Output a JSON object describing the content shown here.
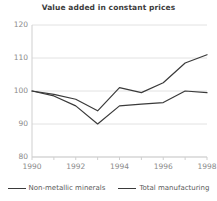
{
  "chart_data": {
    "type": "line",
    "title": "Value added in constant prices",
    "xlabel": "",
    "ylabel": "",
    "x": [
      1990,
      1991,
      1992,
      1993,
      1994,
      1995,
      1996,
      1997,
      1998
    ],
    "xlim": [
      1990,
      1998
    ],
    "ylim": [
      80,
      120
    ],
    "yticks": [
      80,
      90,
      100,
      110,
      120
    ],
    "xticks": [
      1990,
      1992,
      1994,
      1996,
      1998
    ],
    "xtick_labels": [
      "1990",
      "1992",
      "1994",
      "1996",
      "1998"
    ],
    "ytick_labels": [
      "80",
      "90",
      "100",
      "110",
      "120"
    ],
    "grid": true,
    "legend_position": "bottom",
    "series": [
      {
        "name": "Non-metallic minerals",
        "color": "#3a3a3a",
        "values": [
          100.0,
          98.5,
          95.5,
          90.0,
          95.5,
          96.0,
          96.5,
          100.0,
          99.5
        ]
      },
      {
        "name": "Total manufacturing",
        "color": "#3a3a3a",
        "values": [
          100.0,
          99.0,
          97.5,
          94.0,
          101.0,
          99.5,
          102.5,
          108.5,
          111.0
        ]
      }
    ]
  },
  "legend": {
    "items": [
      {
        "label": "Non-metallic minerals"
      },
      {
        "label": "Total manufacturing"
      }
    ]
  },
  "colors": {
    "line": "#3a3a3a",
    "grid": "#e2e2e2",
    "axis": "#cfcfcf",
    "title_text": "#3c3c3c",
    "tick_text": "#8a8a8a"
  }
}
